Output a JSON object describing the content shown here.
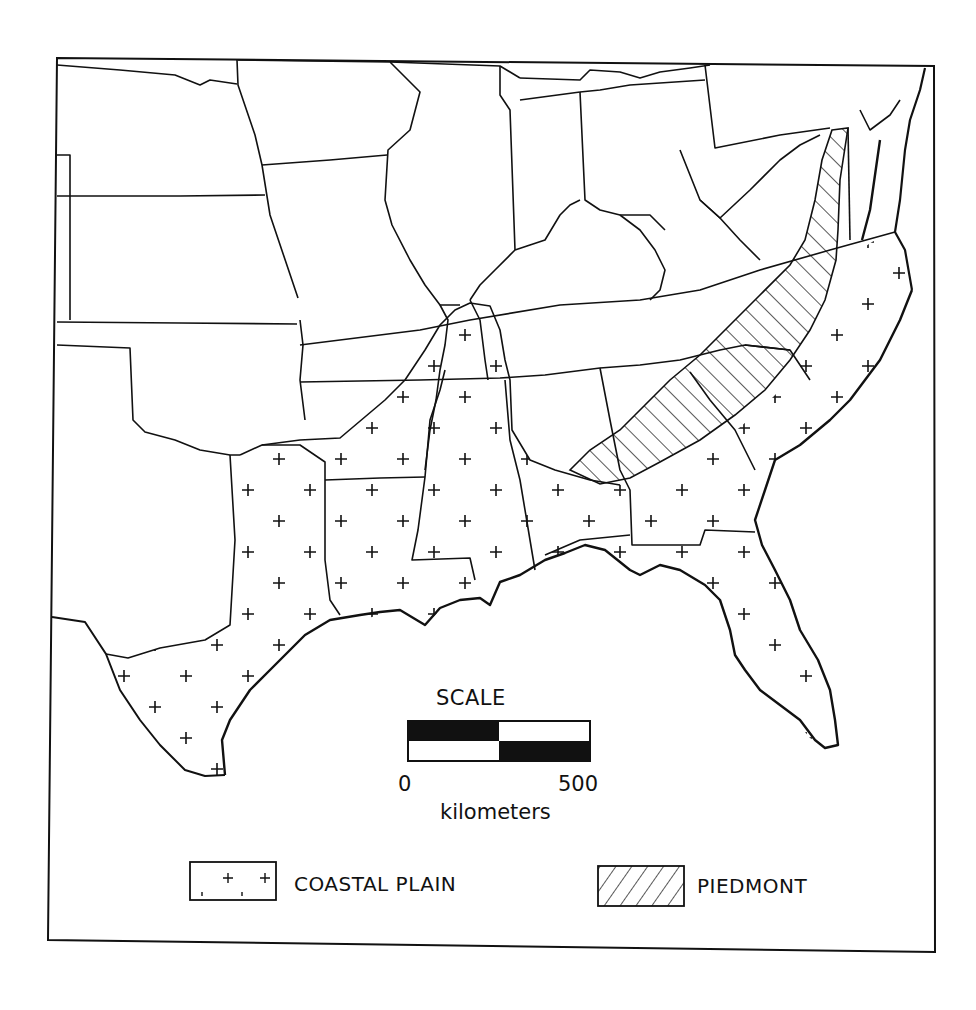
{
  "map": {
    "region": "Southeastern United States",
    "frame": {
      "x": 48,
      "y": 55,
      "width": 887,
      "height": 890
    },
    "colors": {
      "ink": "#111111",
      "background": "#ffffff"
    },
    "regions": [
      {
        "name": "Coastal Plain",
        "pattern": "plus-markers"
      },
      {
        "name": "Piedmont",
        "pattern": "diagonal-hatch"
      }
    ]
  },
  "scale": {
    "title": "SCALE",
    "min_label": "0",
    "max_label": "500",
    "unit": "kilometers"
  },
  "legend": {
    "items": [
      {
        "label": "COASTAL PLAIN",
        "symbol": "plus-pattern-swatch"
      },
      {
        "label": "PIEDMONT",
        "symbol": "hatch-pattern-swatch"
      }
    ]
  }
}
